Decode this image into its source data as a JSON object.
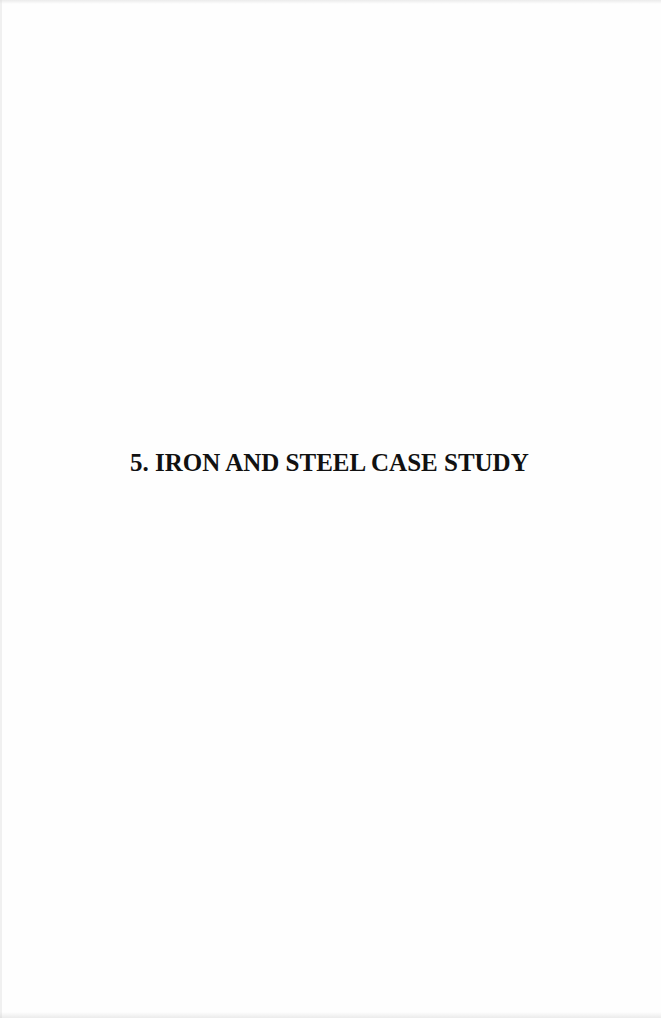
{
  "document": {
    "section_number": "5.",
    "section_title": "5. IRON AND STEEL CASE STUDY",
    "text_color": "#111111",
    "background_color": "#fefefe"
  }
}
